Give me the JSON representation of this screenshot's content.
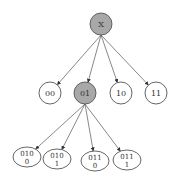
{
  "diagram": {
    "type": "tree",
    "colors": {
      "highlighted_fill": "#a8a8a8",
      "normal_fill": "#ffffff",
      "stroke": "#555555",
      "edge": "#6a6a6a"
    },
    "nodes": [
      {
        "id": "root",
        "lines": [
          "X"
        ],
        "highlighted": true
      },
      {
        "id": "n00",
        "lines": [
          "00"
        ],
        "highlighted": false
      },
      {
        "id": "n01",
        "lines": [
          "01"
        ],
        "highlighted": true
      },
      {
        "id": "n10",
        "lines": [
          "10"
        ],
        "highlighted": false
      },
      {
        "id": "n11",
        "lines": [
          "11"
        ],
        "highlighted": false
      },
      {
        "id": "n0100",
        "lines": [
          "010",
          "0"
        ],
        "highlighted": false
      },
      {
        "id": "n0101",
        "lines": [
          "010",
          "1"
        ],
        "highlighted": false
      },
      {
        "id": "n0110",
        "lines": [
          "011",
          "0"
        ],
        "highlighted": false
      },
      {
        "id": "n0111",
        "lines": [
          "011",
          "1"
        ],
        "highlighted": false
      }
    ],
    "edges": [
      {
        "from": "root",
        "to": "n00"
      },
      {
        "from": "root",
        "to": "n01"
      },
      {
        "from": "root",
        "to": "n10"
      },
      {
        "from": "root",
        "to": "n11"
      },
      {
        "from": "n01",
        "to": "n0100"
      },
      {
        "from": "n01",
        "to": "n0101"
      },
      {
        "from": "n01",
        "to": "n0110"
      },
      {
        "from": "n01",
        "to": "n0111"
      }
    ]
  }
}
